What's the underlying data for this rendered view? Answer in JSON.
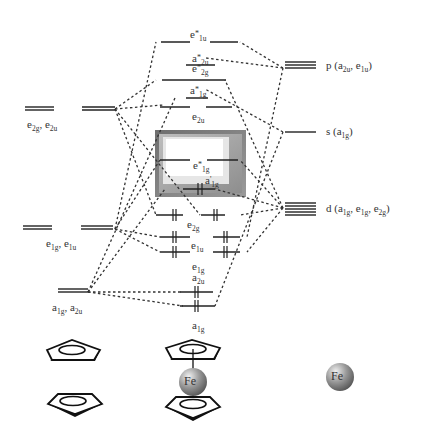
{
  "left_column": {
    "caption": "Cp ligand group orbitals",
    "levels": [
      {
        "id": "e2g_e2u",
        "label": "e2g, e2u",
        "parts": [
          [
            "e",
            "2g"
          ],
          [
            ", e",
            "2u"
          ]
        ]
      },
      {
        "id": "e1g_e1u",
        "label": "e1g, e1u",
        "parts": [
          [
            "e",
            "1g"
          ],
          [
            ", e",
            "1u"
          ]
        ]
      },
      {
        "id": "a1g_a2u",
        "label": "a1g, a2u",
        "parts": [
          [
            "a",
            "1g"
          ],
          [
            ", a",
            "2u"
          ]
        ]
      }
    ]
  },
  "center_column": {
    "caption": "Ferrocene molecular orbitals",
    "levels": [
      {
        "id": "e1u_star",
        "label": "e*1u",
        "electrons": 0
      },
      {
        "id": "a2u_star",
        "label": "a*2u",
        "electrons": 0
      },
      {
        "id": "e2g_star",
        "label": "e*2g",
        "electrons": 0
      },
      {
        "id": "a1g_star",
        "label": "a*1g",
        "electrons": 0
      },
      {
        "id": "e2u",
        "label": "e2u",
        "electrons": 0
      },
      {
        "id": "e1g_star",
        "label": "e*1g",
        "electrons": 0,
        "highlighted": true
      },
      {
        "id": "a1g_prime",
        "label": "a'1g",
        "electrons": 2,
        "highlighted": true
      },
      {
        "id": "e2g",
        "label": "e2g",
        "electrons": 4
      },
      {
        "id": "e1u",
        "label": "e1u",
        "electrons": 4
      },
      {
        "id": "e1g",
        "label": "e1g",
        "electrons": 4
      },
      {
        "id": "a2u",
        "label": "a2u",
        "electrons": 2
      },
      {
        "id": "a1g",
        "label": "a1g",
        "electrons": 2
      }
    ],
    "highlight_box": {
      "label": "frontier orbitals (HOMO/LUMO)",
      "color_outer": "#7a7a7a",
      "color_inner": "#ffffff"
    }
  },
  "right_column": {
    "caption": "Fe atomic orbitals",
    "levels": [
      {
        "id": "p",
        "label": "p (a2u, e1u)"
      },
      {
        "id": "s",
        "label": "s (a1g)"
      },
      {
        "id": "d",
        "label": "d (a1g, e1g, e2g)"
      }
    ]
  },
  "bottom": {
    "ligands_label": "2 Cp rings",
    "complex_label": "Fe",
    "metal_label": "Fe"
  },
  "colors": {
    "line": "#222222",
    "dash": "#333333",
    "sphere": "#8a8a8a"
  }
}
